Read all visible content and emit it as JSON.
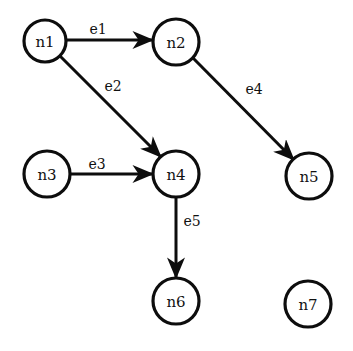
{
  "diagram": {
    "background_color": "#ffffff",
    "stroke_color": "#0d0d0d",
    "text_color": "#111111",
    "width": 353,
    "height": 351
  },
  "nodes": [
    {
      "id": "n1",
      "label": "n1",
      "cx": 45,
      "cy": 41,
      "r": 21
    },
    {
      "id": "n2",
      "label": "n2",
      "cx": 176,
      "cy": 42,
      "r": 23
    },
    {
      "id": "n3",
      "label": "n3",
      "cx": 47,
      "cy": 174,
      "r": 23
    },
    {
      "id": "n4",
      "label": "n4",
      "cx": 176,
      "cy": 174,
      "r": 23
    },
    {
      "id": "n5",
      "label": "n5",
      "cx": 309,
      "cy": 176,
      "r": 23
    },
    {
      "id": "n6",
      "label": "n6",
      "cx": 176,
      "cy": 301,
      "r": 23
    },
    {
      "id": "n7",
      "label": "n7",
      "cx": 308,
      "cy": 304,
      "r": 23
    }
  ],
  "edges": [
    {
      "id": "e1",
      "label": "e1",
      "source": "n1",
      "target": "n2",
      "x1": 66,
      "y1": 40,
      "x2": 153,
      "y2": 40,
      "label_x": 98,
      "label_y": 29
    },
    {
      "id": "e2",
      "label": "e2",
      "source": "n1",
      "target": "n4",
      "x1": 60,
      "y1": 56,
      "x2": 161,
      "y2": 157,
      "label_x": 113,
      "label_y": 86
    },
    {
      "id": "e3",
      "label": "e3",
      "source": "n3",
      "target": "n4",
      "x1": 70,
      "y1": 174,
      "x2": 153,
      "y2": 174,
      "label_x": 97,
      "label_y": 164
    },
    {
      "id": "e4",
      "label": "e4",
      "source": "n2",
      "target": "n5",
      "x1": 193,
      "y1": 58,
      "x2": 294,
      "y2": 160,
      "label_x": 254,
      "label_y": 89
    },
    {
      "id": "e5",
      "label": "e5",
      "source": "n4",
      "target": "n6",
      "x1": 176,
      "y1": 197,
      "x2": 176,
      "y2": 278,
      "label_x": 192,
      "label_y": 221
    }
  ]
}
